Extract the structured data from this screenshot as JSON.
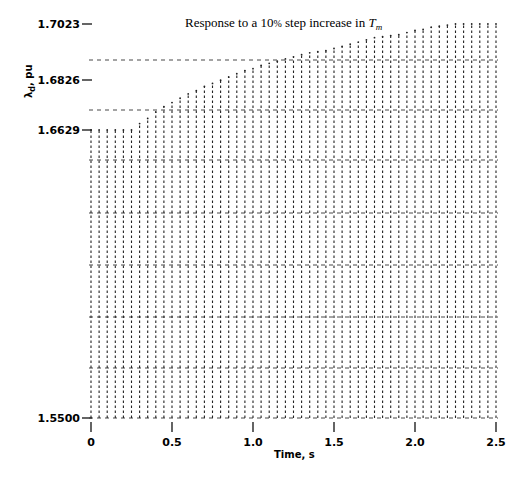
{
  "chart_data": {
    "type": "bar",
    "style": "line-printer dashed columns",
    "title_main": "Response to a 10",
    "title_pct": "%",
    "title_rest": " step increase in ",
    "title_sym": "T",
    "title_sub": "m",
    "xlabel": "Time, s",
    "ylabel": "λd, pu",
    "ylabel_base": "λ",
    "ylabel_sub": "d",
    "ylabel_unit": ", pu",
    "xlim": [
      0,
      2.5
    ],
    "ylim": [
      1.55,
      1.7023
    ],
    "x_ticks": [
      "0",
      "0.5",
      "1.0",
      "1.5",
      "2.0",
      "2.5"
    ],
    "y_ticks": [
      "1.7023",
      "1.6826",
      "1.6629",
      "1.5500"
    ],
    "x": [
      0,
      0.05,
      0.1,
      0.15,
      0.2,
      0.25,
      0.3,
      0.35,
      0.4,
      0.45,
      0.5,
      0.55,
      0.6,
      0.65,
      0.7,
      0.75,
      0.8,
      0.85,
      0.9,
      0.95,
      1.0,
      1.05,
      1.1,
      1.15,
      1.2,
      1.25,
      1.3,
      1.35,
      1.4,
      1.45,
      1.5,
      1.55,
      1.6,
      1.65,
      1.7,
      1.75,
      1.8,
      1.85,
      1.9,
      1.95,
      2.0,
      2.05,
      2.1,
      2.15,
      2.2,
      2.25,
      2.3,
      2.35,
      2.4,
      2.45,
      2.5
    ],
    "values": [
      1.6629,
      1.6629,
      1.6629,
      1.6629,
      1.6629,
      1.6629,
      1.6653,
      1.6672,
      1.6696,
      1.6716,
      1.6731,
      1.6747,
      1.6763,
      1.6775,
      1.6791,
      1.6802,
      1.6814,
      1.6826,
      1.6838,
      1.685,
      1.6857,
      1.6869,
      1.6877,
      1.6885,
      1.6893,
      1.6901,
      1.6909,
      1.6916,
      1.692,
      1.6924,
      1.6932,
      1.694,
      1.6948,
      1.6956,
      1.6964,
      1.6972,
      1.6976,
      1.698,
      1.6983,
      1.6991,
      1.6999,
      1.7003,
      1.7011,
      1.7015,
      1.7019,
      1.7023,
      1.7023,
      1.7023,
      1.7023,
      1.7023,
      1.7023
    ],
    "grid": true,
    "legend": null
  }
}
